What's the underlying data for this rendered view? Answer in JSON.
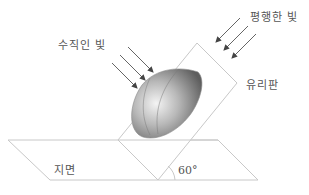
{
  "diagram": {
    "labels": {
      "perpendicular_light": "수직인 빛",
      "parallel_light": "평행한 빛",
      "glass_plate": "유리판",
      "ground": "지면",
      "angle": "60°"
    },
    "colors": {
      "line": "#c8c8c8",
      "arrow": "#555555",
      "text": "#555555",
      "hemisphere_light": "#e8e8e8",
      "hemisphere_dark": "#6a6a6a"
    }
  }
}
